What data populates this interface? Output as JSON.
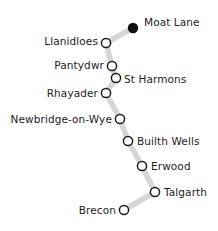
{
  "diagram": {
    "type": "railway-line-map",
    "background_color": "#ffffff",
    "line_color": "#d6d6d6",
    "line_width": 5.5,
    "station_fill": "#ffffff",
    "station_stroke": "#1c1c1c",
    "terminus_fill": "#111111",
    "label_color": "#1c1c1c",
    "width": 218,
    "height": 231
  },
  "stations": [
    {
      "name": "Moat Lane",
      "cx": 133,
      "cy": 28,
      "r": 5.2,
      "marker": "filled",
      "label_x": 144,
      "label_y": 22,
      "anchor": "left"
    },
    {
      "name": "Llanidloes",
      "cx": 106,
      "cy": 43,
      "r": 4.6,
      "marker": "open",
      "label_x": 98,
      "label_y": 41,
      "anchor": "right"
    },
    {
      "name": "Pantydwr",
      "cx": 112,
      "cy": 66,
      "r": 4.6,
      "marker": "open",
      "label_x": 104,
      "label_y": 65,
      "anchor": "right"
    },
    {
      "name": "St Harmons",
      "cx": 116,
      "cy": 78,
      "r": 4.6,
      "marker": "open",
      "label_x": 124,
      "label_y": 79,
      "anchor": "left"
    },
    {
      "name": "Rhayader",
      "cx": 106,
      "cy": 93,
      "r": 4.6,
      "marker": "open",
      "label_x": 98,
      "label_y": 93,
      "anchor": "right"
    },
    {
      "name": "Newbridge-on-Wye",
      "cx": 120,
      "cy": 119,
      "r": 4.6,
      "marker": "open",
      "label_x": 112,
      "label_y": 119,
      "anchor": "right"
    },
    {
      "name": "Builth Wells",
      "cx": 128,
      "cy": 141,
      "r": 4.6,
      "marker": "open",
      "label_x": 137,
      "label_y": 141,
      "anchor": "left"
    },
    {
      "name": "Erwood",
      "cx": 142,
      "cy": 166,
      "r": 4.6,
      "marker": "open",
      "label_x": 151,
      "label_y": 166,
      "anchor": "left"
    },
    {
      "name": "Talgarth",
      "cx": 155,
      "cy": 192,
      "r": 4.6,
      "marker": "open",
      "label_x": 164,
      "label_y": 192,
      "anchor": "left"
    },
    {
      "name": "Brecon",
      "cx": 124,
      "cy": 210,
      "r": 4.6,
      "marker": "open",
      "label_x": 116,
      "label_y": 210,
      "anchor": "right"
    }
  ],
  "route_path": "M 133 28 L 106 43 L 112 66 L 116 78 L 106 93 L 120 119 L 128 141 L 142 166 L 155 192 L 124 210"
}
